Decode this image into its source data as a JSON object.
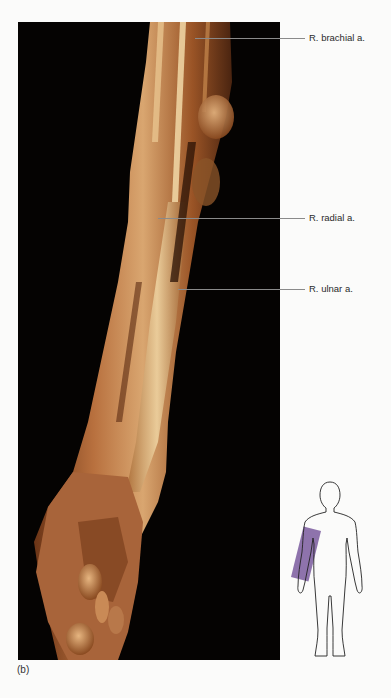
{
  "figure": {
    "panel_letter": "(b)",
    "photo_description": "Cadaveric dissection of the right forearm and hand against a black background",
    "labels": [
      {
        "text": "R. brachial a.",
        "line_y": 38,
        "line_x_start": 195
      },
      {
        "text": "R. radial a.",
        "line_y": 218,
        "line_x_start": 158
      },
      {
        "text": "R. ulnar a.",
        "line_y": 289,
        "line_x_start": 178
      }
    ],
    "orientation_icon": {
      "description": "Human body outline with highlighted right forearm region",
      "highlight_color": "#7a5a9e"
    }
  },
  "colors": {
    "background": "#fbfbfa",
    "photo_background": "#050302",
    "leader_line": "#8a8a8a",
    "label_text": "#2a2a2a"
  }
}
